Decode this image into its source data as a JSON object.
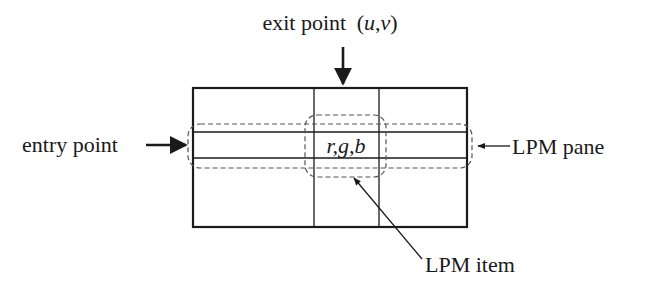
{
  "diagram": {
    "labels": {
      "exit_point": "exit point",
      "exit_coords_open": "(",
      "exit_u": "u",
      "exit_comma": ",",
      "exit_v": "v",
      "exit_coords_close": ")",
      "entry_point": "entry point",
      "lpm_pane": "LPM pane",
      "lpm_item": "LPM item",
      "rgb": "r,g,b"
    },
    "colors": {
      "stroke": "#1a1a1a",
      "dashed": "#555555",
      "background": "#ffffff"
    }
  }
}
